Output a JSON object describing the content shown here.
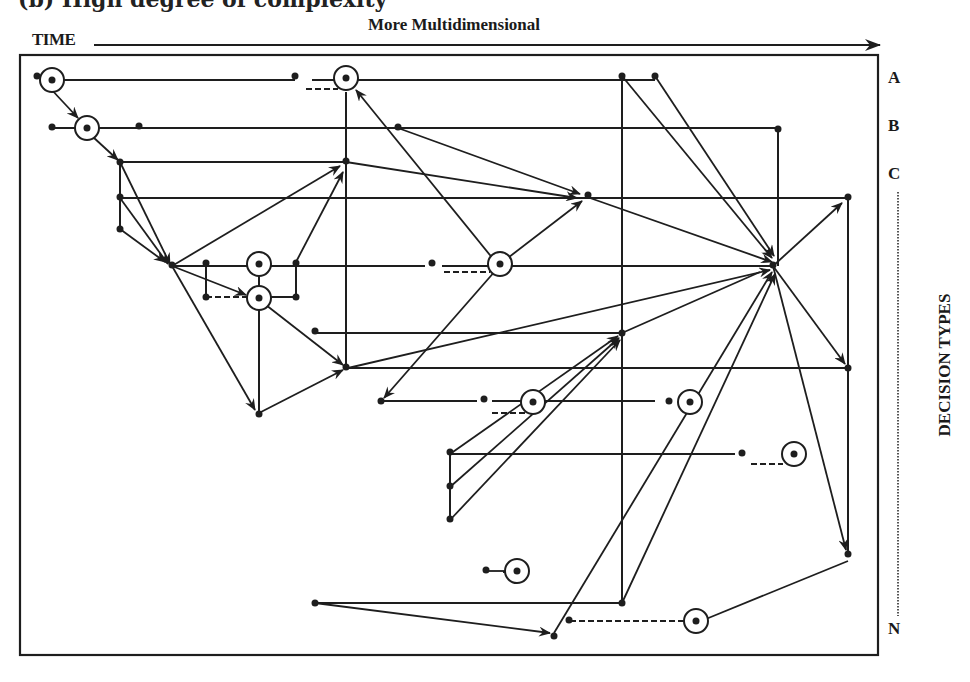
{
  "figure": {
    "cutoff_caption": "(b) High degree of complexity",
    "time_label": "TIME",
    "top_axis_label": "More Multidimensional",
    "right_axis_label": "DECISION TYPES",
    "row_labels": [
      {
        "id": "A",
        "label": "A",
        "y": 80
      },
      {
        "id": "B",
        "label": "B",
        "y": 128
      },
      {
        "id": "C",
        "label": "C",
        "y": 176
      },
      {
        "id": "N",
        "label": "N",
        "y": 630
      }
    ],
    "colors": {
      "ink": "#1e1e1e",
      "background": "#ffffff"
    }
  },
  "diagram": {
    "frame": {
      "x": 20,
      "y": 55,
      "width": 858,
      "height": 600
    },
    "horizontal_lines": [
      {
        "x1": 45,
        "y": 80,
        "x2": 295
      },
      {
        "x1": 312,
        "y": 80,
        "x2": 655
      },
      {
        "x1": 52,
        "y": 128,
        "x2": 778
      },
      {
        "x1": 120,
        "y": 162,
        "x2": 346
      },
      {
        "x1": 120,
        "y": 198,
        "x2": 848
      },
      {
        "x1": 170,
        "y": 266,
        "x2": 425
      },
      {
        "x1": 442,
        "y": 266,
        "x2": 773
      },
      {
        "x1": 270,
        "y": 297,
        "x2": 296
      },
      {
        "x1": 315,
        "y": 333,
        "x2": 622
      },
      {
        "x1": 347,
        "y": 368,
        "x2": 848
      },
      {
        "x1": 381,
        "y": 401,
        "x2": 477
      },
      {
        "x1": 492,
        "y": 401,
        "x2": 655
      },
      {
        "x1": 450,
        "y": 454,
        "x2": 735
      },
      {
        "x1": 315,
        "y": 603,
        "x2": 622
      },
      {
        "x1": 510,
        "y": 572,
        "x2": 503
      }
    ],
    "vertical_lines": [
      {
        "x": 346,
        "y1": 92,
        "y2": 368
      },
      {
        "x": 622,
        "y1": 76,
        "y2": 603
      },
      {
        "x": 778,
        "y1": 128,
        "y2": 266
      },
      {
        "x": 848,
        "y1": 198,
        "y2": 553
      },
      {
        "x": 120,
        "y1": 162,
        "y2": 229
      },
      {
        "x": 206,
        "y1": 262,
        "y2": 297
      },
      {
        "x": 296,
        "y1": 262,
        "y2": 297
      },
      {
        "x": 259,
        "y1": 307,
        "y2": 413
      },
      {
        "x": 259,
        "y1": 275,
        "y2": 289
      },
      {
        "x": 450,
        "y1": 454,
        "y2": 520
      }
    ],
    "dashed_lines": [
      {
        "x1": 306,
        "y1": 89,
        "x2": 338,
        "y2": 89
      },
      {
        "x1": 206,
        "y1": 297,
        "x2": 250,
        "y2": 297
      },
      {
        "x1": 206,
        "y1": 268,
        "x2": 206,
        "y2": 297
      },
      {
        "x1": 444,
        "y1": 272,
        "x2": 490,
        "y2": 272
      },
      {
        "x1": 492,
        "y1": 413,
        "x2": 528,
        "y2": 413
      },
      {
        "x1": 751,
        "y1": 464,
        "x2": 783,
        "y2": 464
      },
      {
        "x1": 570,
        "y1": 621,
        "x2": 688,
        "y2": 621
      }
    ],
    "arrows": [
      {
        "x1": 50,
        "y1": 88,
        "x2": 78,
        "y2": 118
      },
      {
        "x1": 93,
        "y1": 137,
        "x2": 118,
        "y2": 160
      },
      {
        "x1": 120,
        "y1": 162,
        "x2": 170,
        "y2": 264
      },
      {
        "x1": 120,
        "y1": 198,
        "x2": 168,
        "y2": 264
      },
      {
        "x1": 120,
        "y1": 229,
        "x2": 165,
        "y2": 262
      },
      {
        "x1": 172,
        "y1": 266,
        "x2": 340,
        "y2": 166
      },
      {
        "x1": 296,
        "y1": 262,
        "x2": 343,
        "y2": 172
      },
      {
        "x1": 172,
        "y1": 266,
        "x2": 246,
        "y2": 295
      },
      {
        "x1": 172,
        "y1": 266,
        "x2": 255,
        "y2": 410
      },
      {
        "x1": 259,
        "y1": 413,
        "x2": 343,
        "y2": 370
      },
      {
        "x1": 266,
        "y1": 305,
        "x2": 343,
        "y2": 365
      },
      {
        "x1": 346,
        "y1": 162,
        "x2": 577,
        "y2": 198
      },
      {
        "x1": 398,
        "y1": 128,
        "x2": 580,
        "y2": 194
      },
      {
        "x1": 494,
        "y1": 260,
        "x2": 356,
        "y2": 90
      },
      {
        "x1": 500,
        "y1": 264,
        "x2": 582,
        "y2": 201
      },
      {
        "x1": 496,
        "y1": 270,
        "x2": 384,
        "y2": 398
      },
      {
        "x1": 590,
        "y1": 198,
        "x2": 772,
        "y2": 262
      },
      {
        "x1": 622,
        "y1": 76,
        "x2": 772,
        "y2": 258
      },
      {
        "x1": 655,
        "y1": 76,
        "x2": 774,
        "y2": 256
      },
      {
        "x1": 348,
        "y1": 368,
        "x2": 770,
        "y2": 270
      },
      {
        "x1": 773,
        "y1": 266,
        "x2": 842,
        "y2": 203
      },
      {
        "x1": 773,
        "y1": 266,
        "x2": 845,
        "y2": 364
      },
      {
        "x1": 773,
        "y1": 266,
        "x2": 846,
        "y2": 550
      },
      {
        "x1": 450,
        "y1": 454,
        "x2": 618,
        "y2": 336
      },
      {
        "x1": 450,
        "y1": 487,
        "x2": 619,
        "y2": 338
      },
      {
        "x1": 450,
        "y1": 520,
        "x2": 620,
        "y2": 340
      },
      {
        "x1": 554,
        "y1": 633,
        "x2": 772,
        "y2": 272
      },
      {
        "x1": 622,
        "y1": 603,
        "x2": 775,
        "y2": 274
      },
      {
        "x1": 315,
        "y1": 603,
        "x2": 550,
        "y2": 633
      }
    ],
    "plain_segments": [
      {
        "x1": 848,
        "y1": 561,
        "x2": 706,
        "y2": 619
      },
      {
        "x1": 622,
        "y1": 333,
        "x2": 760,
        "y2": 272
      },
      {
        "x1": 488,
        "y1": 571,
        "x2": 508,
        "y2": 571
      }
    ],
    "circles": [
      {
        "x": 52,
        "y": 80,
        "r": 12
      },
      {
        "x": 87,
        "y": 128,
        "r": 12
      },
      {
        "x": 346,
        "y": 78,
        "r": 12
      },
      {
        "x": 259,
        "y": 264,
        "r": 12
      },
      {
        "x": 259,
        "y": 298,
        "r": 12
      },
      {
        "x": 500,
        "y": 264,
        "r": 12
      },
      {
        "x": 533,
        "y": 402,
        "r": 12
      },
      {
        "x": 690,
        "y": 402,
        "r": 12
      },
      {
        "x": 794,
        "y": 454,
        "r": 12
      },
      {
        "x": 517,
        "y": 571,
        "r": 12
      },
      {
        "x": 696,
        "y": 621,
        "r": 12
      }
    ],
    "dots": [
      {
        "x": 37,
        "y": 76
      },
      {
        "x": 295,
        "y": 76
      },
      {
        "x": 52,
        "y": 127
      },
      {
        "x": 139,
        "y": 126
      },
      {
        "x": 398,
        "y": 127
      },
      {
        "x": 778,
        "y": 129
      },
      {
        "x": 120,
        "y": 162
      },
      {
        "x": 346,
        "y": 161
      },
      {
        "x": 120,
        "y": 197
      },
      {
        "x": 588,
        "y": 195
      },
      {
        "x": 848,
        "y": 197
      },
      {
        "x": 120,
        "y": 229
      },
      {
        "x": 172,
        "y": 265
      },
      {
        "x": 206,
        "y": 263
      },
      {
        "x": 296,
        "y": 263
      },
      {
        "x": 432,
        "y": 263
      },
      {
        "x": 773,
        "y": 265
      },
      {
        "x": 206,
        "y": 297
      },
      {
        "x": 296,
        "y": 297
      },
      {
        "x": 315,
        "y": 331
      },
      {
        "x": 622,
        "y": 333
      },
      {
        "x": 346,
        "y": 367
      },
      {
        "x": 848,
        "y": 368
      },
      {
        "x": 381,
        "y": 401
      },
      {
        "x": 484,
        "y": 399
      },
      {
        "x": 669,
        "y": 401
      },
      {
        "x": 259,
        "y": 414
      },
      {
        "x": 450,
        "y": 452
      },
      {
        "x": 742,
        "y": 453
      },
      {
        "x": 450,
        "y": 486
      },
      {
        "x": 450,
        "y": 519
      },
      {
        "x": 486,
        "y": 570
      },
      {
        "x": 848,
        "y": 554
      },
      {
        "x": 315,
        "y": 603
      },
      {
        "x": 622,
        "y": 603
      },
      {
        "x": 569,
        "y": 620
      },
      {
        "x": 554,
        "y": 636
      },
      {
        "x": 622,
        "y": 76
      },
      {
        "x": 655,
        "y": 76
      }
    ]
  }
}
